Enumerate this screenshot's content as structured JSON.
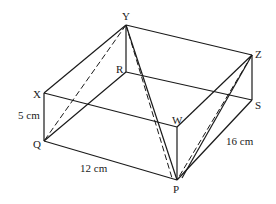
{
  "diagram": {
    "type": "cuboid",
    "vertices": {
      "Y": {
        "label": "Y",
        "x": 126,
        "y": 25
      },
      "Z": {
        "label": "Z",
        "x": 252,
        "y": 55
      },
      "X": {
        "label": "X",
        "x": 44,
        "y": 93
      },
      "W": {
        "label": "W",
        "x": 177,
        "y": 127
      },
      "R": {
        "label": "R",
        "x": 126,
        "y": 72
      },
      "S": {
        "label": "S",
        "x": 252,
        "y": 100
      },
      "Q": {
        "label": "Q",
        "x": 44,
        "y": 141
      },
      "P": {
        "label": "P",
        "x": 177,
        "y": 180
      }
    },
    "dimensions": {
      "height": "5 cm",
      "length": "12 cm",
      "width": "16 cm"
    }
  }
}
